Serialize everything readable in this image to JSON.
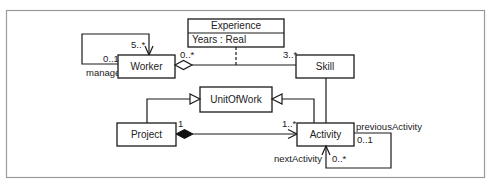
{
  "diagram": {
    "type": "UML class diagram",
    "classes": {
      "worker": {
        "name": "Worker"
      },
      "experience": {
        "name": "Experience",
        "attributes": [
          "Years : Real"
        ]
      },
      "skill": {
        "name": "Skill"
      },
      "unit_of_work": {
        "name": "UnitOfWork"
      },
      "project": {
        "name": "Project"
      },
      "activity": {
        "name": "Activity"
      }
    },
    "relationships": {
      "worker_manager": {
        "kind": "self-association",
        "near_multiplicity": "5..*",
        "far_multiplicity": "0..1",
        "role": "manager"
      },
      "worker_skill": {
        "kind": "aggregation",
        "worker_multiplicity": "0..*",
        "skill_multiplicity": "3..*",
        "association_class": "Experience"
      },
      "project_activity": {
        "kind": "composition",
        "project_multiplicity": "1",
        "activity_multiplicity": "1..*"
      },
      "activity_sequence": {
        "kind": "self-association",
        "prev_role": "previousActivity",
        "prev_multiplicity": "0..1",
        "next_role": "nextActivity",
        "next_multiplicity": "0..*"
      },
      "generalizations": [
        "Project → UnitOfWork",
        "Activity → UnitOfWork"
      ],
      "skill_activity": {
        "kind": "association"
      }
    }
  }
}
